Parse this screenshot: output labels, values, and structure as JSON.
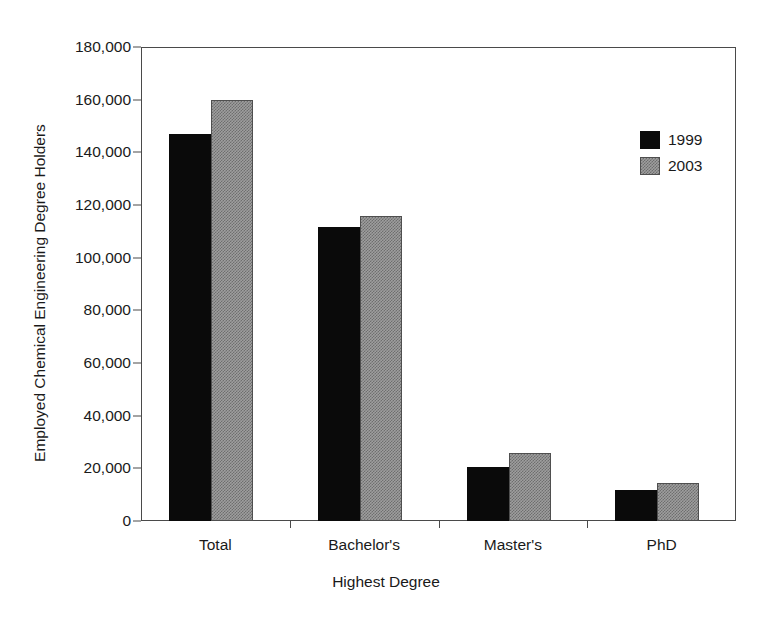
{
  "chart_data": {
    "type": "bar",
    "title": "",
    "xlabel": "Highest Degree",
    "ylabel": "Employed Chemical Engineering Degree Holders",
    "categories": [
      "Total",
      "Bachelor's",
      "Master's",
      "PhD"
    ],
    "series": [
      {
        "name": "1999",
        "color": "#0a0a0a",
        "values": [
          147000,
          111500,
          20500,
          11800
        ]
      },
      {
        "name": "2003",
        "color": "#9e9e9e",
        "values": [
          160000,
          116000,
          25800,
          14500
        ]
      }
    ],
    "ylim": [
      0,
      180000
    ],
    "ytick_values": [
      0,
      20000,
      40000,
      60000,
      80000,
      100000,
      120000,
      140000,
      160000,
      180000
    ],
    "ytick_labels": [
      "0",
      "20,000",
      "40,000",
      "60,000",
      "80,000",
      "100,000",
      "120,000",
      "140,000",
      "160,000",
      "180,000"
    ],
    "grid": false,
    "legend_position": "upper right",
    "frame": true
  },
  "legend": {
    "entries": [
      {
        "label": "1999"
      },
      {
        "label": "2003"
      }
    ]
  }
}
